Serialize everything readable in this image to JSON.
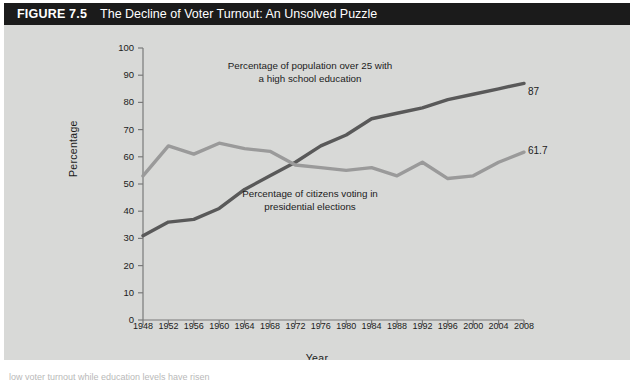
{
  "figure": {
    "number_label": "FIGURE 7.5",
    "title": "The Decline of Voter Turnout: An Unsolved Puzzle"
  },
  "caption": {
    "partial_text": "low voter turnout while education levels have risen"
  },
  "chart_data": {
    "type": "line",
    "title": "The Decline of Voter Turnout: An Unsolved Puzzle",
    "xlabel": "Year",
    "ylabel": "Percentage",
    "xlim": [
      1948,
      2008
    ],
    "ylim": [
      0,
      100
    ],
    "grid": false,
    "legend_position": "inline-annotations",
    "x": [
      1948,
      1952,
      1956,
      1960,
      1964,
      1968,
      1972,
      1976,
      1980,
      1984,
      1988,
      1992,
      1996,
      2000,
      2004,
      2008
    ],
    "y_ticks": [
      0,
      10,
      20,
      30,
      40,
      50,
      60,
      70,
      80,
      90,
      100
    ],
    "x_ticks": [
      "1948",
      "1952",
      "1956",
      "1960",
      "1964",
      "1968",
      "1972",
      "1976",
      "1980",
      "1984",
      "1988",
      "1992",
      "1996",
      "2000",
      "2004",
      "2008"
    ],
    "series": [
      {
        "name": "Percentage of population over 25 with a high school education",
        "annotation": "Percentage of population over 25 with\na high school education",
        "color": "#595959",
        "end_label": "87",
        "values": [
          31,
          36,
          37,
          41,
          48,
          53,
          58,
          64,
          68,
          74,
          76,
          78,
          81,
          83,
          85,
          87
        ]
      },
      {
        "name": "Percentage of citizens voting in presidential elections",
        "annotation": "Percentage of citizens voting in\npresidential elections",
        "color": "#9a9a9a",
        "end_label": "61.7",
        "values": [
          53,
          64,
          61,
          65,
          63,
          62,
          57,
          56,
          55,
          56,
          53,
          58,
          52,
          53,
          58,
          61.7
        ]
      }
    ]
  },
  "colors": {
    "background": "#d8d9d7",
    "title_bar": "#1b1b1b",
    "title_text": "#ffffff",
    "axis": "#7a7a7a",
    "education_line": "#595959",
    "turnout_line": "#9a9a9a"
  }
}
